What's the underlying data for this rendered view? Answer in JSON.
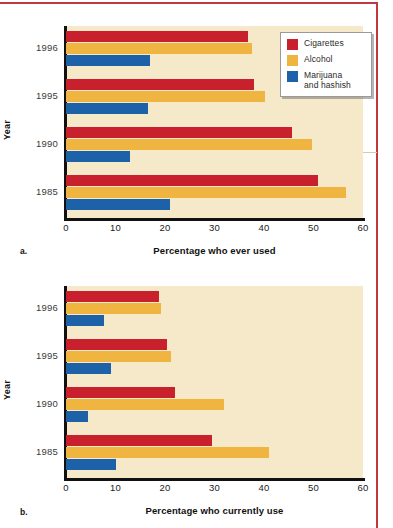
{
  "figure": {
    "accent_border_color": "#c0393f",
    "plot_background": "#f6e9c9",
    "series_colors": {
      "cigarettes": "#c8202c",
      "alcohol": "#f0b440",
      "marijuana": "#1d61a8"
    }
  },
  "legend": {
    "items": [
      {
        "key": "cig",
        "label": "Cigarettes"
      },
      {
        "key": "alc",
        "label": "Alcohol"
      },
      {
        "key": "mar",
        "label": "Marijuana\nand hashish"
      }
    ],
    "marijuana_line1": "Marijuana",
    "marijuana_line2": "and hashish"
  },
  "panel_a": {
    "letter": "a.",
    "ylabel": "Year",
    "xlabel": "Percentage who ever used"
  },
  "panel_b": {
    "letter": "b.",
    "ylabel": "Year",
    "xlabel": "Percentage who currently use"
  },
  "chart_data": [
    {
      "type": "bar",
      "orientation": "horizontal",
      "panel": "a.",
      "title": "",
      "xlabel": "Percentage who ever used",
      "ylabel": "Year",
      "xlim": [
        0,
        60
      ],
      "xticks": [
        0,
        10,
        20,
        30,
        40,
        50,
        60
      ],
      "categories": [
        "1996",
        "1995",
        "1990",
        "1985"
      ],
      "grid": false,
      "legend_position": "top-right",
      "series": [
        {
          "name": "Cigarettes",
          "color": "#c8202c",
          "values": [
            36.7,
            38.0,
            45.6,
            51.0
          ]
        },
        {
          "name": "Alcohol",
          "color": "#f0b440",
          "values": [
            37.6,
            40.3,
            49.6,
            56.5
          ]
        },
        {
          "name": "Marijuana and hashish",
          "color": "#1d61a8",
          "values": [
            17.0,
            16.5,
            13.0,
            21.0
          ]
        }
      ]
    },
    {
      "type": "bar",
      "orientation": "horizontal",
      "panel": "b.",
      "title": "",
      "xlabel": "Percentage who currently use",
      "ylabel": "Year",
      "xlim": [
        0,
        60
      ],
      "xticks": [
        0,
        10,
        20,
        30,
        40,
        50,
        60
      ],
      "categories": [
        "1996",
        "1995",
        "1990",
        "1985"
      ],
      "grid": false,
      "legend_position": "top-right",
      "series": [
        {
          "name": "Cigarettes",
          "color": "#c8202c",
          "values": [
            18.8,
            20.4,
            22.0,
            29.5
          ]
        },
        {
          "name": "Alcohol",
          "color": "#f0b440",
          "values": [
            19.2,
            21.2,
            32.0,
            41.0
          ]
        },
        {
          "name": "Marijuana and hashish",
          "color": "#1d61a8",
          "values": [
            7.7,
            9.1,
            4.4,
            10.0
          ]
        }
      ]
    }
  ]
}
